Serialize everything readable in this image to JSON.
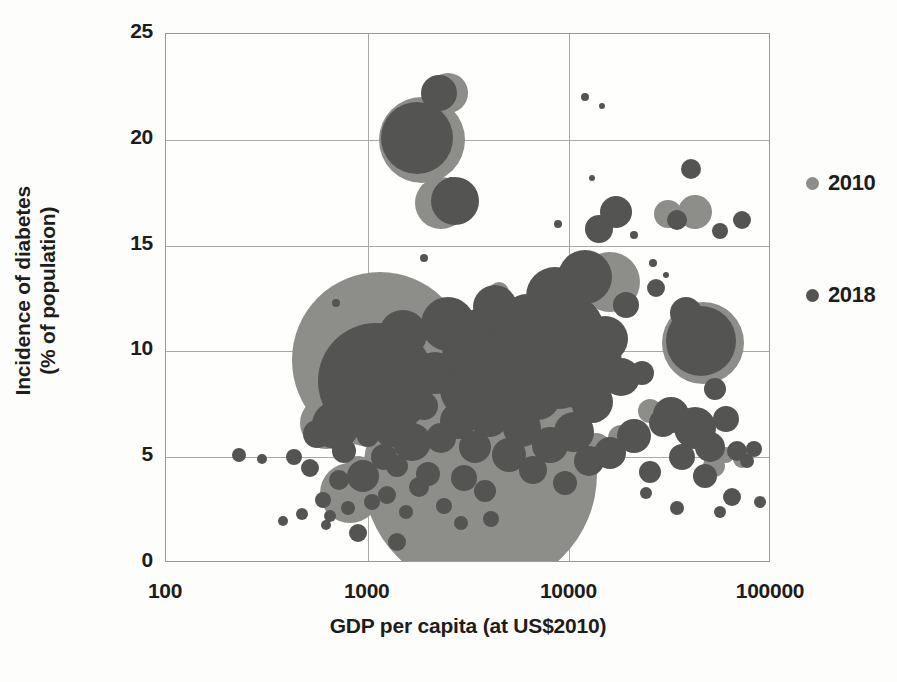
{
  "chart_data": {
    "type": "scatter",
    "title": "",
    "xlabel": "GDP per capita (at US$2010)",
    "ylabel": "Incidence of diabetes\n(% of population)",
    "xscale": "log",
    "yscale": "linear",
    "xlim": [
      100,
      100000
    ],
    "ylim": [
      0,
      25
    ],
    "xticks": [
      "100",
      "1000",
      "10000",
      "100000"
    ],
    "xtick_values": [
      100,
      1000,
      10000,
      100000
    ],
    "yticks": [
      "0",
      "5",
      "10",
      "15",
      "20",
      "25"
    ],
    "ytick_values": [
      0,
      5,
      10,
      15,
      20,
      25
    ],
    "grid": true,
    "legend_position": "right",
    "bubble_size_encodes": "population",
    "series": [
      {
        "name": "2010",
        "color": "#8d8d8a",
        "points": [
          {
            "x": 1400,
            "y": 2.1,
            "r": 9
          },
          {
            "x": 620,
            "y": 6.6,
            "r": 26
          },
          {
            "x": 820,
            "y": 3.3,
            "r": 30
          },
          {
            "x": 900,
            "y": 4.4,
            "r": 14
          },
          {
            "x": 1150,
            "y": 9.6,
            "r": 88
          },
          {
            "x": 1500,
            "y": 2.6,
            "r": 12
          },
          {
            "x": 2100,
            "y": 5.2,
            "r": 18
          },
          {
            "x": 2600,
            "y": 3.5,
            "r": 11
          },
          {
            "x": 3600,
            "y": 4.2,
            "r": 117
          },
          {
            "x": 5200,
            "y": 6.8,
            "r": 20
          },
          {
            "x": 7000,
            "y": 11.0,
            "r": 15
          },
          {
            "x": 9200,
            "y": 6.1,
            "r": 22
          },
          {
            "x": 11000,
            "y": 9.2,
            "r": 31
          },
          {
            "x": 13500,
            "y": 5.4,
            "r": 16
          },
          {
            "x": 18000,
            "y": 5.9,
            "r": 13
          },
          {
            "x": 25000,
            "y": 7.2,
            "r": 12
          },
          {
            "x": 31000,
            "y": 16.5,
            "r": 14
          },
          {
            "x": 42000,
            "y": 16.6,
            "r": 17
          },
          {
            "x": 46000,
            "y": 10.4,
            "r": 41
          },
          {
            "x": 52000,
            "y": 4.6,
            "r": 11
          },
          {
            "x": 60000,
            "y": 5.1,
            "r": 8
          },
          {
            "x": 72000,
            "y": 4.9,
            "r": 9
          },
          {
            "x": 2300,
            "y": 17.0,
            "r": 26
          },
          {
            "x": 1850,
            "y": 20.0,
            "r": 43
          },
          {
            "x": 2500,
            "y": 22.2,
            "r": 20
          },
          {
            "x": 1500,
            "y": 12.0,
            "r": 13
          },
          {
            "x": 4500,
            "y": 12.8,
            "r": 10
          },
          {
            "x": 16000,
            "y": 13.3,
            "r": 30
          }
        ]
      },
      {
        "name": "2018",
        "color": "#545453",
        "points": [
          {
            "x": 230,
            "y": 5.1,
            "r": 7
          },
          {
            "x": 300,
            "y": 4.9,
            "r": 5
          },
          {
            "x": 380,
            "y": 2.0,
            "r": 5
          },
          {
            "x": 430,
            "y": 5.0,
            "r": 8
          },
          {
            "x": 470,
            "y": 2.3,
            "r": 6
          },
          {
            "x": 520,
            "y": 4.5,
            "r": 9
          },
          {
            "x": 560,
            "y": 6.1,
            "r": 14
          },
          {
            "x": 600,
            "y": 3.0,
            "r": 8
          },
          {
            "x": 650,
            "y": 2.2,
            "r": 6
          },
          {
            "x": 700,
            "y": 6.5,
            "r": 24
          },
          {
            "x": 720,
            "y": 3.9,
            "r": 10
          },
          {
            "x": 760,
            "y": 5.3,
            "r": 12
          },
          {
            "x": 800,
            "y": 2.6,
            "r": 7
          },
          {
            "x": 880,
            "y": 7.0,
            "r": 13
          },
          {
            "x": 900,
            "y": 1.4,
            "r": 9
          },
          {
            "x": 950,
            "y": 4.1,
            "r": 16
          },
          {
            "x": 1000,
            "y": 6.0,
            "r": 11
          },
          {
            "x": 1050,
            "y": 2.9,
            "r": 8
          },
          {
            "x": 1100,
            "y": 8.6,
            "r": 58
          },
          {
            "x": 1200,
            "y": 5.0,
            "r": 13
          },
          {
            "x": 1250,
            "y": 3.2,
            "r": 9
          },
          {
            "x": 1300,
            "y": 6.3,
            "r": 17
          },
          {
            "x": 1400,
            "y": 4.6,
            "r": 11
          },
          {
            "x": 1500,
            "y": 10.8,
            "r": 24
          },
          {
            "x": 1550,
            "y": 2.4,
            "r": 7
          },
          {
            "x": 1650,
            "y": 5.7,
            "r": 19
          },
          {
            "x": 1750,
            "y": 20.1,
            "r": 36
          },
          {
            "x": 1800,
            "y": 3.6,
            "r": 10
          },
          {
            "x": 1900,
            "y": 7.4,
            "r": 14
          },
          {
            "x": 2000,
            "y": 4.2,
            "r": 12
          },
          {
            "x": 2150,
            "y": 9.0,
            "r": 21
          },
          {
            "x": 2250,
            "y": 22.2,
            "r": 18
          },
          {
            "x": 2300,
            "y": 5.9,
            "r": 15
          },
          {
            "x": 2400,
            "y": 2.7,
            "r": 8
          },
          {
            "x": 2500,
            "y": 11.3,
            "r": 27
          },
          {
            "x": 2700,
            "y": 17.1,
            "r": 24
          },
          {
            "x": 2800,
            "y": 6.7,
            "r": 18
          },
          {
            "x": 3000,
            "y": 4.0,
            "r": 13
          },
          {
            "x": 3200,
            "y": 8.2,
            "r": 30
          },
          {
            "x": 3400,
            "y": 5.5,
            "r": 16
          },
          {
            "x": 3600,
            "y": 10.2,
            "r": 38
          },
          {
            "x": 3800,
            "y": 3.4,
            "r": 11
          },
          {
            "x": 4000,
            "y": 6.9,
            "r": 20
          },
          {
            "x": 4300,
            "y": 12.1,
            "r": 22
          },
          {
            "x": 4600,
            "y": 8.0,
            "r": 25
          },
          {
            "x": 5000,
            "y": 5.1,
            "r": 17
          },
          {
            "x": 5400,
            "y": 9.8,
            "r": 33
          },
          {
            "x": 5800,
            "y": 6.4,
            "r": 19
          },
          {
            "x": 6200,
            "y": 11.5,
            "r": 26
          },
          {
            "x": 6600,
            "y": 4.4,
            "r": 14
          },
          {
            "x": 7000,
            "y": 7.8,
            "r": 22
          },
          {
            "x": 7500,
            "y": 10.0,
            "r": 41
          },
          {
            "x": 8000,
            "y": 5.6,
            "r": 18
          },
          {
            "x": 8500,
            "y": 12.6,
            "r": 29
          },
          {
            "x": 9000,
            "y": 8.4,
            "r": 24
          },
          {
            "x": 9500,
            "y": 3.8,
            "r": 12
          },
          {
            "x": 10000,
            "y": 11.0,
            "r": 35
          },
          {
            "x": 10500,
            "y": 6.2,
            "r": 20
          },
          {
            "x": 11000,
            "y": 9.4,
            "r": 44
          },
          {
            "x": 12000,
            "y": 13.5,
            "r": 27
          },
          {
            "x": 12500,
            "y": 4.8,
            "r": 15
          },
          {
            "x": 13000,
            "y": 7.6,
            "r": 21
          },
          {
            "x": 14000,
            "y": 15.8,
            "r": 14
          },
          {
            "x": 15000,
            "y": 10.6,
            "r": 23
          },
          {
            "x": 16000,
            "y": 5.2,
            "r": 16
          },
          {
            "x": 17000,
            "y": 16.6,
            "r": 16
          },
          {
            "x": 18000,
            "y": 8.8,
            "r": 19
          },
          {
            "x": 19000,
            "y": 12.2,
            "r": 13
          },
          {
            "x": 21000,
            "y": 6.0,
            "r": 17
          },
          {
            "x": 23000,
            "y": 9.0,
            "r": 12
          },
          {
            "x": 25000,
            "y": 4.3,
            "r": 11
          },
          {
            "x": 27000,
            "y": 13.0,
            "r": 9
          },
          {
            "x": 29000,
            "y": 6.6,
            "r": 14
          },
          {
            "x": 32000,
            "y": 7.0,
            "r": 18
          },
          {
            "x": 34000,
            "y": 16.2,
            "r": 10
          },
          {
            "x": 36000,
            "y": 5.0,
            "r": 13
          },
          {
            "x": 38000,
            "y": 11.8,
            "r": 16
          },
          {
            "x": 40000,
            "y": 18.6,
            "r": 10
          },
          {
            "x": 42000,
            "y": 6.4,
            "r": 21
          },
          {
            "x": 45000,
            "y": 10.5,
            "r": 35
          },
          {
            "x": 47000,
            "y": 4.1,
            "r": 12
          },
          {
            "x": 50000,
            "y": 5.5,
            "r": 15
          },
          {
            "x": 53000,
            "y": 8.2,
            "r": 11
          },
          {
            "x": 56000,
            "y": 15.7,
            "r": 8
          },
          {
            "x": 60000,
            "y": 6.8,
            "r": 13
          },
          {
            "x": 64000,
            "y": 3.1,
            "r": 9
          },
          {
            "x": 68000,
            "y": 5.3,
            "r": 10
          },
          {
            "x": 72000,
            "y": 16.2,
            "r": 9
          },
          {
            "x": 76000,
            "y": 4.8,
            "r": 7
          },
          {
            "x": 82000,
            "y": 5.4,
            "r": 8
          },
          {
            "x": 88000,
            "y": 2.9,
            "r": 6
          },
          {
            "x": 12000,
            "y": 22.0,
            "r": 4
          },
          {
            "x": 14500,
            "y": 21.6,
            "r": 3
          },
          {
            "x": 13000,
            "y": 18.2,
            "r": 3
          },
          {
            "x": 21000,
            "y": 15.5,
            "r": 4
          },
          {
            "x": 8800,
            "y": 16.0,
            "r": 4
          },
          {
            "x": 26000,
            "y": 14.2,
            "r": 4
          },
          {
            "x": 30000,
            "y": 13.6,
            "r": 3
          },
          {
            "x": 2600,
            "y": 18.0,
            "r": 5
          },
          {
            "x": 700,
            "y": 12.3,
            "r": 4
          },
          {
            "x": 1900,
            "y": 14.4,
            "r": 4
          },
          {
            "x": 1400,
            "y": 1.0,
            "r": 9
          },
          {
            "x": 2900,
            "y": 1.9,
            "r": 7
          },
          {
            "x": 620,
            "y": 1.8,
            "r": 5
          },
          {
            "x": 34000,
            "y": 2.6,
            "r": 7
          },
          {
            "x": 56000,
            "y": 2.4,
            "r": 6
          },
          {
            "x": 24000,
            "y": 3.3,
            "r": 6
          },
          {
            "x": 4100,
            "y": 2.1,
            "r": 8
          }
        ]
      }
    ]
  },
  "axes": {
    "y_title": "Incidence of diabetes\n(% of population)",
    "x_title": "GDP per capita (at US$2010)"
  },
  "legend": {
    "items": [
      {
        "label": "2010",
        "color": "#8d8d8a",
        "dot_size": 13
      },
      {
        "label": "2018",
        "color": "#545453",
        "dot_size": 13
      }
    ]
  },
  "colors": {
    "series_2010": "#8d8d8a",
    "series_2018": "#545453",
    "grid": "#a9a9a6",
    "frame": "#9a9a97",
    "text": "#1d1d1b",
    "background": "#fdfdfc"
  }
}
